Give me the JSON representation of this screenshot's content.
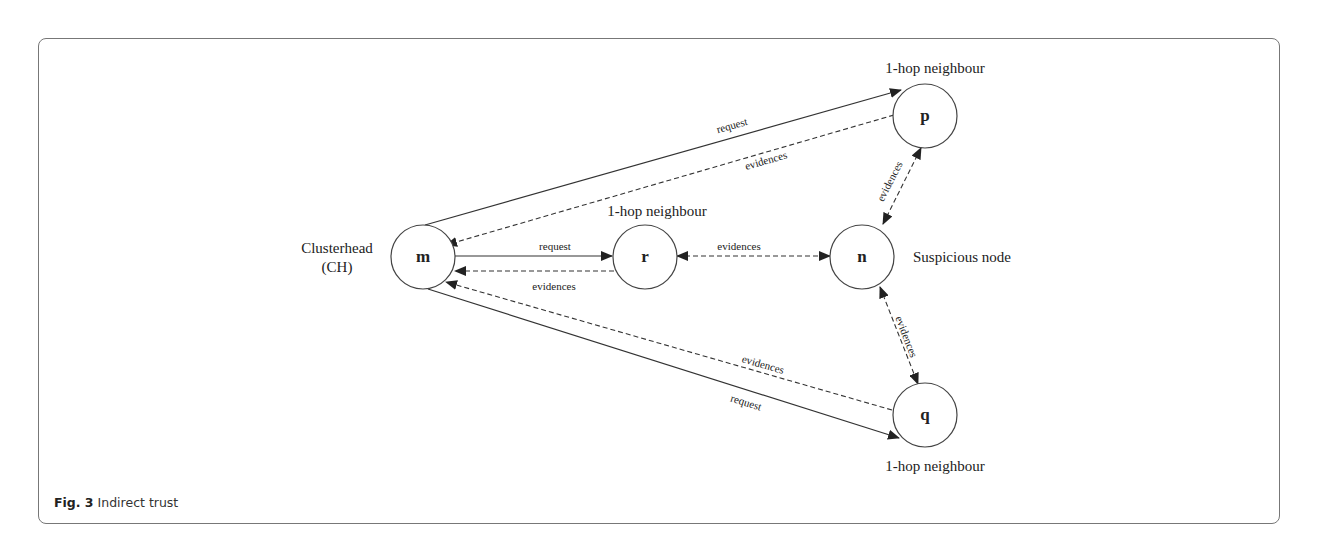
{
  "figure": {
    "caption_bold": "Fig. 3",
    "caption_text": "Indirect trust"
  },
  "nodes": {
    "m": {
      "letter": "m",
      "label_line1": "Clusterhead",
      "label_line2": "(CH)"
    },
    "r": {
      "letter": "r",
      "label": "1-hop neighbour"
    },
    "n": {
      "letter": "n",
      "label": "Suspicious node"
    },
    "p": {
      "letter": "p",
      "label": "1-hop neighbour"
    },
    "q": {
      "letter": "q",
      "label": "1-hop neighbour"
    }
  },
  "edges": {
    "m_to_p_request": "request",
    "p_to_m_evidences": "evidences",
    "m_to_r_request": "request",
    "r_to_m_evidences": "evidences",
    "r_n_evidences": "evidences",
    "p_n_evidences": "evidences",
    "n_q_evidences": "evidences",
    "q_to_m_evidences": "evidences",
    "m_to_q_request": "request"
  }
}
